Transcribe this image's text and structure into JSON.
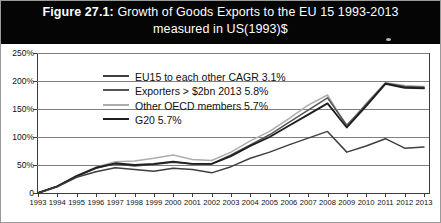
{
  "figure": {
    "number_label": "Figure 27.1:",
    "title_line1": " Growth of Goods Exports to the EU 15 1993-2013",
    "title_line2": "measured in US(1993)$"
  },
  "legend": {
    "position": "top-left-inside-plot",
    "items": [
      {
        "label": "EU15 to each other CAGR 3.1%",
        "color": "#3f3f3f"
      },
      {
        "label": "Exporters > $2bn 2013 5.8%",
        "color": "#555555"
      },
      {
        "label": "Other OECD members 5.7%",
        "color": "#adadad"
      },
      {
        "label": "G20 5.7%",
        "color": "#1f1f1f"
      }
    ]
  },
  "axes": {
    "y_ticks": [
      "250%",
      "200%",
      "150%",
      "100%",
      "50%",
      "0"
    ],
    "y_values": [
      250,
      200,
      150,
      100,
      50,
      0
    ],
    "x_ticks": [
      "1993",
      "1994",
      "1995",
      "1996",
      "1997",
      "1998",
      "1999",
      "2000",
      "2001",
      "2002",
      "2003",
      "2004",
      "2005",
      "2006",
      "2007",
      "2008",
      "2009",
      "2010",
      "2011",
      "2012",
      "2013"
    ]
  },
  "chart_data": {
    "type": "line",
    "title": "Figure 27.1: Growth of Goods Exports to the EU 15 1993-2013 measured in US(1993)$",
    "subtitle": "measured in US(1993)$",
    "xlabel": "",
    "ylabel": "",
    "ylim": [
      0,
      250
    ],
    "xlim": [
      "1993",
      "2013"
    ],
    "grid": true,
    "legend_position": "upper left",
    "x": [
      1993,
      1994,
      1995,
      1996,
      1997,
      1998,
      1999,
      2000,
      2001,
      2002,
      2003,
      2004,
      2005,
      2006,
      2007,
      2008,
      2009,
      2010,
      2011,
      2012,
      2013
    ],
    "series": [
      {
        "name": "EU15 to each other CAGR 3.1%",
        "color": "#3f3f3f",
        "values": [
          0,
          11,
          28,
          38,
          45,
          42,
          39,
          44,
          42,
          36,
          47,
          62,
          73,
          86,
          98,
          110,
          73,
          84,
          97,
          80,
          82
        ]
      },
      {
        "name": "Exporters > $2bn 2013 5.8%",
        "color": "#555555",
        "values": [
          0,
          12,
          30,
          44,
          52,
          48,
          51,
          55,
          52,
          52,
          68,
          86,
          104,
          126,
          148,
          170,
          121,
          158,
          196,
          190,
          189
        ]
      },
      {
        "name": "Other OECD members 5.7%",
        "color": "#adadad",
        "values": [
          0,
          12,
          31,
          46,
          56,
          57,
          62,
          68,
          60,
          58,
          73,
          93,
          110,
          133,
          157,
          175,
          118,
          160,
          197,
          192,
          190
        ]
      },
      {
        "name": "G20 5.7%",
        "color": "#1f1f1f",
        "values": [
          0,
          12,
          30,
          45,
          53,
          50,
          52,
          56,
          52,
          52,
          66,
          84,
          100,
          120,
          140,
          160,
          117,
          155,
          195,
          188,
          187
        ]
      }
    ]
  }
}
